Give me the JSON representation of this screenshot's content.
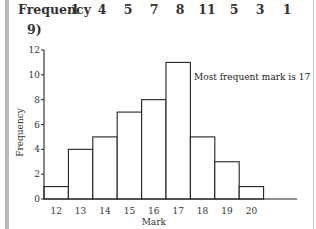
{
  "header": {
    "frequency_label": "Frequency",
    "frequency_values": [
      "1",
      "4",
      "5",
      "7",
      "8",
      "11",
      "5",
      "3",
      "1"
    ],
    "question_number": "9)"
  },
  "chart_data": {
    "type": "bar",
    "title": "",
    "xlabel": "Mark",
    "ylabel": "Frequency",
    "categories": [
      "12",
      "13",
      "14",
      "15",
      "16",
      "17",
      "18",
      "19",
      "20"
    ],
    "values": [
      1,
      4,
      5,
      7,
      8,
      11,
      5,
      3,
      1
    ],
    "ylim": [
      0,
      12
    ],
    "yticks": [
      "0",
      "2",
      "4",
      "6",
      "8",
      "10",
      "12"
    ],
    "grid": false,
    "legend": "none",
    "annotation": "Most frequent mark is 17",
    "histogram": true
  }
}
